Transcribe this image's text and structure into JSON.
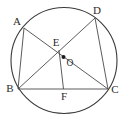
{
  "figure": {
    "background_color": "#ffffff",
    "stroke_color": "#3a3a3a",
    "label_color": "#2b2b2b"
  },
  "circle": {
    "name": "circumcircle",
    "center_x": 64,
    "center_y": 60.5,
    "radius": 53,
    "stroke_width": 1.1
  },
  "center_dot": {
    "label": "O",
    "x": 63.5,
    "y": 57,
    "dot_radius": 2.0,
    "label_x": 70,
    "label_y": 63.5
  },
  "points": [
    {
      "label": "A",
      "x": 24,
      "y": 28,
      "label_x": 17,
      "label_y": 22
    },
    {
      "label": "D",
      "x": 95,
      "y": 18,
      "label_x": 97,
      "label_y": 11
    },
    {
      "label": "B",
      "x": 18,
      "y": 89,
      "label_x": 10,
      "label_y": 89
    },
    {
      "label": "C",
      "x": 108,
      "y": 89,
      "label_x": 115,
      "label_y": 90
    },
    {
      "label": "E",
      "x": 59,
      "y": 50,
      "label_x": 56,
      "label_y": 43
    },
    {
      "label": "F",
      "x": 63.5,
      "y": 89,
      "label_x": 64,
      "label_y": 97
    }
  ],
  "segments": [
    {
      "name": "segment-AB",
      "from": "A",
      "to": "B"
    },
    {
      "name": "segment-AC",
      "from": "A",
      "to": "C"
    },
    {
      "name": "segment-BC",
      "from": "B",
      "to": "C"
    },
    {
      "name": "segment-BD",
      "from": "B",
      "to": "D"
    },
    {
      "name": "segment-DC",
      "from": "D",
      "to": "C"
    },
    {
      "name": "segment-EF",
      "from": "E",
      "to": "F"
    }
  ],
  "labels_text": {
    "A": "A",
    "B": "B",
    "C": "C",
    "D": "D",
    "E": "E",
    "F": "F",
    "O": "O"
  }
}
